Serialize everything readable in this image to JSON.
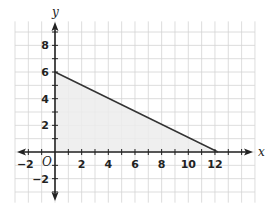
{
  "chart_data": {
    "type": "line",
    "title": "",
    "xlabel": "x",
    "ylabel": "y",
    "origin_label": "O",
    "xlim": [
      -3,
      15
    ],
    "ylim": [
      -3.8,
      9.8
    ],
    "grid": true,
    "x_ticks": [
      -2,
      2,
      4,
      6,
      8,
      10,
      12
    ],
    "y_ticks": [
      -2,
      2,
      4,
      6,
      8
    ],
    "x_tick_labels": [
      "−2",
      "2",
      "4",
      "6",
      "8",
      "10",
      "12"
    ],
    "y_tick_labels": [
      "−2",
      "2",
      "4",
      "6",
      "8"
    ],
    "series": [
      {
        "name": "boundary line",
        "points": [
          [
            0,
            6
          ],
          [
            12,
            0
          ]
        ],
        "color": "#333333"
      }
    ],
    "shaded_region": {
      "vertices": [
        [
          0,
          0
        ],
        [
          0,
          6
        ],
        [
          12,
          0
        ]
      ],
      "color": "#ececec"
    },
    "colors": {
      "grid": "#d4d4d4",
      "axis": "#222222",
      "shade": "#ececec",
      "line": "#333333"
    }
  }
}
